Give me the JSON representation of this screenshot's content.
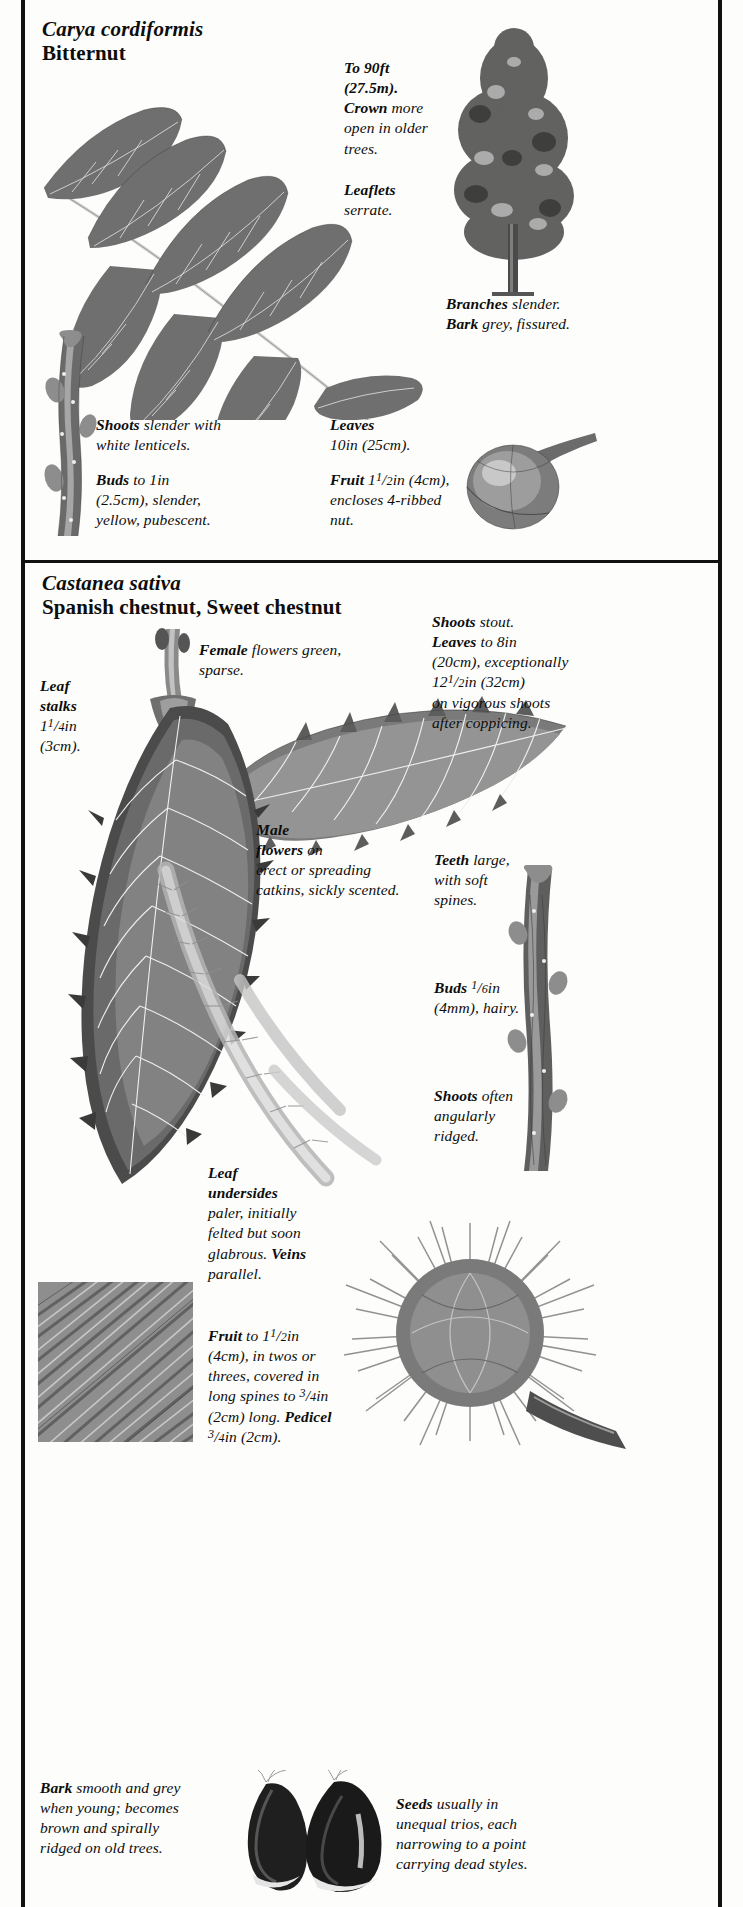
{
  "page": {
    "background_color": "#fdfdfb",
    "ink_color": "#111111"
  },
  "sections": [
    {
      "id": "carya-cordiformis",
      "latin_name": "Carya cordiformis",
      "common_name": "Bitternut",
      "captions": [
        {
          "name": "height-crown",
          "lines": [
            {
              "bold": "To 90ft",
              "rest": ""
            },
            {
              "bold": "(27.5m).",
              "rest": ""
            },
            {
              "bold": "Crown",
              "rest": " more"
            },
            {
              "bold": "",
              "rest": "open in older"
            },
            {
              "bold": "",
              "rest": "trees."
            }
          ]
        },
        {
          "name": "leaflets",
          "lines": [
            {
              "bold": "Leaflets",
              "rest": ""
            },
            {
              "bold": "",
              "rest": "serrate."
            }
          ]
        },
        {
          "name": "branches-bark",
          "lines": [
            {
              "bold": "Branches",
              "rest": " slender."
            },
            {
              "bold": "Bark",
              "rest": " grey, fissured."
            }
          ]
        },
        {
          "name": "shoots",
          "lines": [
            {
              "bold": "Shoots",
              "rest": " slender with"
            },
            {
              "bold": "",
              "rest": "white lenticels."
            }
          ]
        },
        {
          "name": "leaves",
          "lines": [
            {
              "bold": "Leaves",
              "rest": ""
            },
            {
              "bold": "",
              "rest": "10in (25cm)."
            }
          ]
        },
        {
          "name": "buds",
          "lines": [
            {
              "bold": "Buds",
              "rest": " to 1in"
            },
            {
              "bold": "",
              "rest": "(2.5cm), slender,"
            },
            {
              "bold": "",
              "rest": "yellow, pubescent."
            }
          ]
        },
        {
          "name": "fruit",
          "lines": [
            {
              "bold": "Fruit",
              "rest": " 1<span class=\"frac\">1</span>/<span class=\"den\">2</span>in (4cm),"
            },
            {
              "bold": "",
              "rest": "encloses 4-ribbed"
            },
            {
              "bold": "",
              "rest": "nut."
            }
          ]
        }
      ]
    },
    {
      "id": "castanea-sativa",
      "latin_name": "Castanea sativa",
      "common_name": "Spanish chestnut, Sweet chestnut",
      "captions": [
        {
          "name": "female-flowers",
          "lines": [
            {
              "bold": "Female",
              "rest": " flowers green,"
            },
            {
              "bold": "",
              "rest": "sparse."
            }
          ]
        },
        {
          "name": "shoots-leaves",
          "lines": [
            {
              "bold": "Shoots",
              "rest": " stout."
            },
            {
              "bold": "Leaves",
              "rest": " to 8in"
            },
            {
              "bold": "",
              "rest": "(20cm), exceptionally"
            },
            {
              "bold": "",
              "rest": "12<span class=\"frac\">1</span>/<span class=\"den\">2</span>in (32cm)"
            },
            {
              "bold": "",
              "rest": "on vigorous shoots"
            },
            {
              "bold": "",
              "rest": "after coppicing."
            }
          ]
        },
        {
          "name": "leaf-stalks",
          "lines": [
            {
              "bold": "Leaf",
              "rest": ""
            },
            {
              "bold": "stalks",
              "rest": ""
            },
            {
              "bold": "",
              "rest": "1<span class=\"frac\">1</span>/<span class=\"den\">4</span>in"
            },
            {
              "bold": "",
              "rest": "(3cm)."
            }
          ]
        },
        {
          "name": "male-flowers",
          "lines": [
            {
              "bold": "Male",
              "rest": ""
            },
            {
              "bold": "flowers",
              "rest": " on"
            },
            {
              "bold": "",
              "rest": "erect or spreading"
            },
            {
              "bold": "",
              "rest": "catkins, sickly scented."
            }
          ]
        },
        {
          "name": "teeth",
          "lines": [
            {
              "bold": "Teeth",
              "rest": " large,"
            },
            {
              "bold": "",
              "rest": "with soft"
            },
            {
              "bold": "",
              "rest": "spines."
            }
          ]
        },
        {
          "name": "buds",
          "lines": [
            {
              "bold": "Buds",
              "rest": " <span class=\"frac\">1</span>/<span class=\"den\">6</span>in"
            },
            {
              "bold": "",
              "rest": "(4mm), hairy."
            }
          ]
        },
        {
          "name": "shoots-ridged",
          "lines": [
            {
              "bold": "Shoots",
              "rest": " often"
            },
            {
              "bold": "",
              "rest": "angularly"
            },
            {
              "bold": "",
              "rest": "ridged."
            }
          ]
        },
        {
          "name": "leaf-undersides",
          "lines": [
            {
              "bold": "Leaf",
              "rest": ""
            },
            {
              "bold": "undersides",
              "rest": ""
            },
            {
              "bold": "",
              "rest": "paler, initially"
            },
            {
              "bold": "",
              "rest": "felted but soon"
            },
            {
              "bold": "glabrous.",
              "rest": " <b>Veins</b>",
              "mixed": true
            },
            {
              "bold": "",
              "rest": "parallel."
            }
          ]
        },
        {
          "name": "fruit",
          "lines": [
            {
              "bold": "Fruit",
              "rest": " to 1<span class=\"frac\">1</span>/<span class=\"den\">2</span>in"
            },
            {
              "bold": "",
              "rest": "(4cm), in twos or"
            },
            {
              "bold": "",
              "rest": "threes, covered in"
            },
            {
              "bold": "",
              "rest": "long spines to <span class=\"frac\">3</span>/<span class=\"den\">4</span>in"
            },
            {
              "bold": "",
              "rest": "(2cm) long. <b>Pedicel</b>",
              "mixed": true
            },
            {
              "bold": "",
              "rest": "<span class=\"frac\">3</span>/<span class=\"den\">4</span>in (2cm)."
            }
          ]
        },
        {
          "name": "bark",
          "lines": [
            {
              "bold": "Bark",
              "rest": " smooth and grey"
            },
            {
              "bold": "",
              "rest": "when young; becomes"
            },
            {
              "bold": "",
              "rest": "brown and spirally"
            },
            {
              "bold": "",
              "rest": "ridged on old trees."
            }
          ]
        },
        {
          "name": "seeds",
          "lines": [
            {
              "bold": "Seeds",
              "rest": " usually in"
            },
            {
              "bold": "",
              "rest": "unequal trios, each"
            },
            {
              "bold": "",
              "rest": "narrowing to a point"
            },
            {
              "bold": "",
              "rest": "carrying dead styles."
            }
          ]
        }
      ]
    }
  ],
  "illustrations": [
    {
      "name": "bitternut-compound-leaf",
      "species": "Carya cordiformis"
    },
    {
      "name": "bitternut-tree-habit",
      "species": "Carya cordiformis"
    },
    {
      "name": "bitternut-winter-shoot-buds",
      "species": "Carya cordiformis"
    },
    {
      "name": "bitternut-fruit-nut",
      "species": "Carya cordiformis"
    },
    {
      "name": "chestnut-female-flower-catkin",
      "species": "Castanea sativa"
    },
    {
      "name": "chestnut-leaf-upper-surface",
      "species": "Castanea sativa"
    },
    {
      "name": "chestnut-leaf-underside",
      "species": "Castanea sativa"
    },
    {
      "name": "chestnut-male-catkin",
      "species": "Castanea sativa"
    },
    {
      "name": "chestnut-winter-shoot-buds",
      "species": "Castanea sativa"
    },
    {
      "name": "chestnut-bark-texture",
      "species": "Castanea sativa"
    },
    {
      "name": "chestnut-spiny-bur-fruit",
      "species": "Castanea sativa"
    },
    {
      "name": "chestnut-seeds-nuts",
      "species": "Castanea sativa"
    }
  ]
}
